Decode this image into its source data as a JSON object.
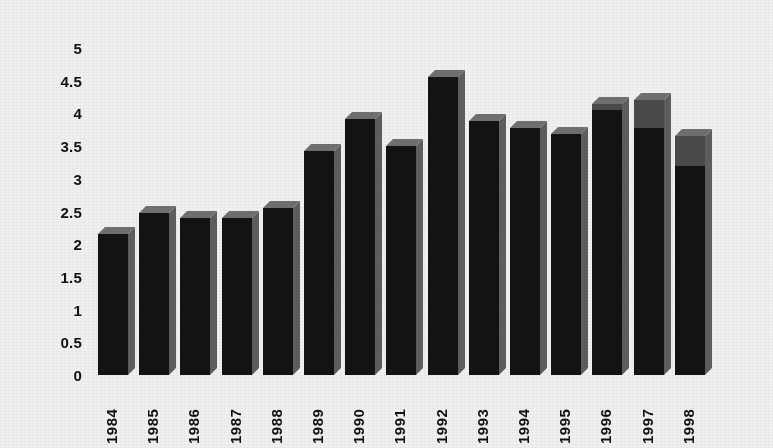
{
  "chart_data": {
    "type": "bar",
    "title": "",
    "subtitle": "",
    "xlabel": "",
    "ylabel": "",
    "categories": [
      "1984",
      "1985",
      "1986",
      "1987",
      "1988",
      "1989",
      "1990",
      "1991",
      "1992",
      "1993",
      "1994",
      "1995",
      "1996",
      "1997",
      "1998"
    ],
    "values": [
      2.15,
      2.48,
      2.4,
      2.4,
      2.55,
      3.42,
      3.92,
      3.5,
      4.55,
      3.88,
      3.78,
      3.68,
      4.15,
      4.2,
      3.65
    ],
    "series": [
      {
        "name": "",
        "values": [
          2.15,
          2.48,
          2.4,
          2.4,
          2.55,
          3.42,
          3.92,
          3.5,
          4.55,
          3.88,
          3.78,
          3.68,
          4.15,
          4.2,
          3.65
        ]
      }
    ],
    "segment_upper_values": [
      0,
      0,
      0,
      0,
      0,
      0,
      0,
      0,
      0,
      0,
      0,
      0,
      0.1,
      0.42,
      0.45
    ],
    "ylim": [
      0,
      5
    ],
    "ytick_step": 0.5,
    "ytick_labels": [
      "5",
      "4.5",
      "4",
      "3.5",
      "3",
      "2.5",
      "2",
      "1.5",
      "1",
      "0.5",
      "0"
    ],
    "ytick_values": [
      5,
      4.5,
      4,
      3.5,
      3,
      2.5,
      2,
      1.5,
      1,
      0.5,
      0
    ],
    "grid": false,
    "legend": "none",
    "style_3d": true,
    "bar_colors": {
      "front": "#131313",
      "front_upper": "#4a4a4a",
      "top": "#707070",
      "side": "#5e5e5e"
    },
    "background_color": "#f1f0ee",
    "text_color": "#111111"
  }
}
